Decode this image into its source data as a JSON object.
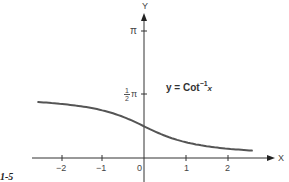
{
  "figure": {
    "label": "1-5",
    "equation": {
      "prefix": "y = Cot",
      "superscript": "−1",
      "variable": "x"
    }
  },
  "axes": {
    "x_label": "X",
    "y_label": "Y",
    "x_ticks": [
      "−2",
      "−1",
      "0",
      "1",
      "2"
    ],
    "y_ticks": {
      "pi": "π",
      "half_pi_num": "1",
      "half_pi_den": "2",
      "half_pi_sym": "π"
    }
  },
  "colors": {
    "curve": "#555555",
    "axis": "#333333",
    "text": "#444444"
  },
  "chart_data": {
    "type": "line",
    "xlabel": "X",
    "ylabel": "Y",
    "x_ticks": [
      -2,
      -1,
      0,
      1,
      2
    ],
    "y_ticks": [
      {
        "value": 1.5708,
        "label": "½π"
      },
      {
        "value": 3.1416,
        "label": "π"
      }
    ],
    "xlim": [
      -2.7,
      3.1
    ],
    "ylim": [
      -0.6,
      3.5
    ],
    "grid": false,
    "legend": "none",
    "series": [
      {
        "name": "y = Cot⁻¹x",
        "x": [
          -2.55,
          -2.0,
          -1.5,
          -1.0,
          -0.5,
          0,
          0.5,
          1.0,
          1.5,
          2.0,
          2.6
        ],
        "values": [
          2.75,
          2.68,
          2.55,
          2.36,
          2.03,
          1.57,
          1.11,
          0.79,
          0.59,
          0.46,
          0.37
        ]
      }
    ]
  }
}
